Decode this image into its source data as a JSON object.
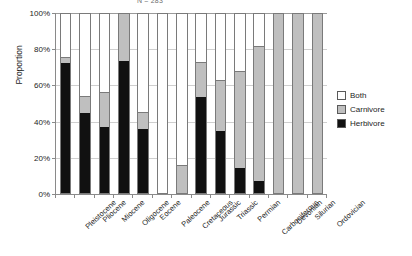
{
  "chart_data": {
    "type": "bar",
    "subtype": "stacked-100-percent",
    "title": "N = 283",
    "xlabel": "",
    "ylabel": "Proportion",
    "ylim": [
      0,
      100
    ],
    "yticks": [
      "0%",
      "20%",
      "40%",
      "60%",
      "80%",
      "100%"
    ],
    "ytick_values": [
      0,
      20,
      40,
      60,
      80,
      100
    ],
    "grid": true,
    "legend_position": "right",
    "categories": [
      "Pleistocene",
      "Pliocene",
      "Miocene",
      "Oligocene",
      "Eocene",
      "Paleocene",
      "Cretaceous",
      "Jurassic",
      "Triassic",
      "Permian",
      "Carboniferous",
      "Devonian",
      "Silurian",
      "Ordovician"
    ],
    "series": [
      {
        "name": "Herbivore",
        "color": "#111111",
        "values": [
          73,
          45,
          37,
          74,
          36,
          0,
          0,
          54,
          35,
          14,
          7,
          0,
          0,
          0
        ]
      },
      {
        "name": "Carnivore",
        "color": "#bfbfbf",
        "values": [
          3,
          9,
          19,
          26,
          9,
          0,
          15,
          19,
          28,
          54,
          75,
          100,
          100,
          100
        ]
      },
      {
        "name": "Both",
        "color": "#ffffff",
        "values": [
          24,
          46,
          44,
          0,
          55,
          100,
          85,
          27,
          37,
          32,
          18,
          0,
          0,
          0
        ]
      }
    ],
    "legend": [
      {
        "label": "Both",
        "swatch": "both"
      },
      {
        "label": "Carnivore",
        "swatch": "carnivore"
      },
      {
        "label": "Herbivore",
        "swatch": "herbivore"
      }
    ]
  }
}
